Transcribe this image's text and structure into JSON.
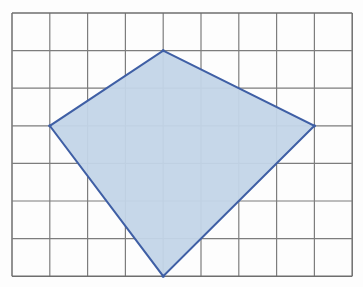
{
  "figure": {
    "type": "geometry-diagram",
    "canvas": {
      "width": 363,
      "height": 287,
      "background_color": "#fdfdfd"
    },
    "grid": {
      "columns": 9,
      "rows": 7,
      "origin_x": 12,
      "origin_y": 13,
      "cell_width": 37.8,
      "cell_height": 37.6,
      "line_color": "#7d7d7d",
      "line_width": 1.2,
      "border_color": "#6e6e6e",
      "border_width": 1.5,
      "label": "square grid 9 by 7"
    },
    "shape": {
      "name": "kite",
      "sides": 4,
      "fill_color": "#c3d5e8",
      "fill_opacity": 0.95,
      "stroke_color": "#3f5fa5",
      "stroke_width": 2,
      "vertices_grid": [
        {
          "name": "top-vertex",
          "col": 4,
          "row": 1
        },
        {
          "name": "right-vertex",
          "col": 8,
          "row": 3
        },
        {
          "name": "bottom-vertex",
          "col": 4,
          "row": 7
        },
        {
          "name": "left-vertex",
          "col": 1,
          "row": 3
        }
      ],
      "vertices_px": [
        {
          "name": "top-vertex",
          "x": 163,
          "y": 51
        },
        {
          "name": "right-vertex",
          "x": 314,
          "y": 126
        },
        {
          "name": "bottom-vertex",
          "x": 163,
          "y": 276
        },
        {
          "name": "left-vertex",
          "x": 50,
          "y": 126
        }
      ]
    }
  }
}
